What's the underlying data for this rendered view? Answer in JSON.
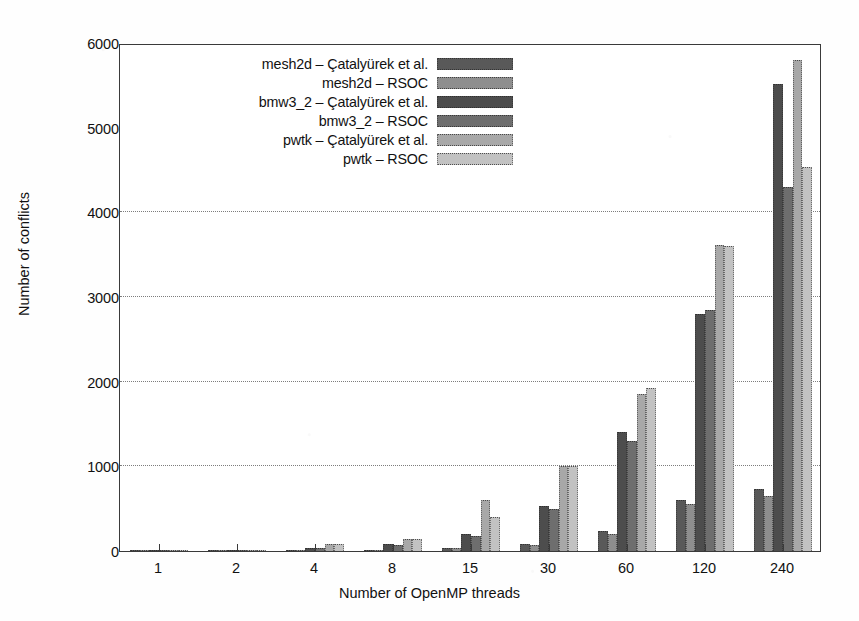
{
  "chart_data": {
    "type": "bar",
    "title": "",
    "subtitle": "",
    "xlabel": "Number of OpenMP threads",
    "ylabel": "Number of conflicts",
    "categories": [
      "1",
      "2",
      "4",
      "8",
      "15",
      "30",
      "60",
      "120",
      "240"
    ],
    "ylim": [
      0,
      6000
    ],
    "yticks": [
      0,
      1000,
      2000,
      3000,
      4000,
      5000,
      6000
    ],
    "ytick_labels": [
      "0",
      "1000",
      "2000",
      "3000",
      "4000",
      "5000",
      "6000"
    ],
    "grid": "horizontal-dotted",
    "gridline_values": [
      1000,
      2000,
      3000,
      4000
    ],
    "legend_position": "top-left-inside",
    "orientation": "vertical",
    "grouping": "clustered",
    "series": [
      {
        "name": "mesh2d – Çatalyürek et al.",
        "color": "#595959",
        "values": [
          1,
          3,
          6,
          12,
          30,
          80,
          240,
          600,
          730
        ]
      },
      {
        "name": "mesh2d – RSOC",
        "color": "#8e8e8e",
        "values": [
          1,
          4,
          8,
          16,
          40,
          75,
          200,
          550,
          650
        ]
      },
      {
        "name": "bmw3_2 – Çatalyürek et al.",
        "color": "#4d4d4d",
        "values": [
          2,
          10,
          40,
          80,
          200,
          530,
          1400,
          2800,
          5520
        ]
      },
      {
        "name": "bmw3_2 – RSOC",
        "color": "#6e6e6e",
        "values": [
          2,
          9,
          38,
          75,
          180,
          500,
          1300,
          2850,
          4300
        ]
      },
      {
        "name": "pwtk – Çatalyürek et al.",
        "color": "#a8a8a8",
        "values": [
          2,
          12,
          80,
          140,
          600,
          1000,
          1850,
          3620,
          5800
        ]
      },
      {
        "name": "pwtk – RSOC",
        "color": "#c2c2c2",
        "values": [
          2,
          11,
          78,
          145,
          400,
          1000,
          1930,
          3600,
          4530
        ]
      }
    ],
    "legend_entries": [
      "mesh2d – Çatalyürek et al.",
      "mesh2d – RSOC",
      "bmw3_2 – Çatalyürek et al.",
      "bmw3_2 – RSOC",
      "pwtk – Çatalyürek et al.",
      "pwtk – RSOC"
    ],
    "axis_color": "#3a3a3a",
    "grid_color": "#7d7d7d",
    "background": "#ffffff"
  }
}
